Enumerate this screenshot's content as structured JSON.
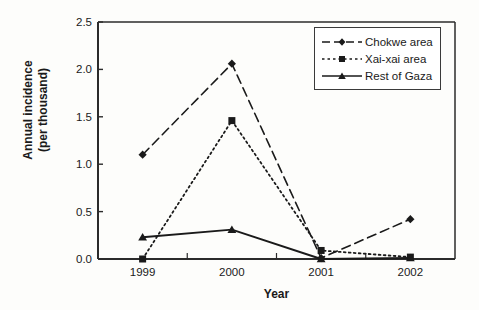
{
  "chart_data": {
    "type": "line",
    "title": "",
    "xlabel": "Year",
    "ylabel": "Annual incidence\n(per thousand)",
    "ylabel_line1": "Annual incidence",
    "ylabel_line2": "(per thousand)",
    "categories": [
      "1999",
      "2000",
      "2001",
      "2002"
    ],
    "ylim": [
      0.0,
      2.5
    ],
    "ytick_labels": [
      "0.0",
      "0.5",
      "1.0",
      "1.5",
      "2.0",
      "2.5"
    ],
    "ytick_values": [
      0.0,
      0.5,
      1.0,
      1.5,
      2.0,
      2.5
    ],
    "grid": false,
    "legend_position": "top-right",
    "series": [
      {
        "name": "Chokwe area",
        "values": [
          1.1,
          2.06,
          0.01,
          0.42
        ],
        "marker": "diamond",
        "line_style": "dashed",
        "color": "#1a1a1a"
      },
      {
        "name": "Xai-xai area",
        "values": [
          0.0,
          1.46,
          0.09,
          0.02
        ],
        "marker": "square",
        "line_style": "dotted",
        "color": "#1a1a1a"
      },
      {
        "name": "Rest of Gaza",
        "values": [
          0.23,
          0.31,
          0.0,
          0.01
        ],
        "marker": "triangle",
        "line_style": "solid",
        "color": "#1a1a1a"
      }
    ]
  },
  "axes": {
    "x_title": "Year",
    "y_title_line1": "Annual incidence",
    "y_title_line2": "(per thousand)"
  },
  "legend": {
    "items": [
      {
        "label": "Chokwe area"
      },
      {
        "label": "Xai-xai area"
      },
      {
        "label": "Rest of Gaza"
      }
    ]
  },
  "colors": {
    "ink": "#1a1a1a",
    "axis": "#2b2b2b",
    "background": "#fdfdfb"
  }
}
